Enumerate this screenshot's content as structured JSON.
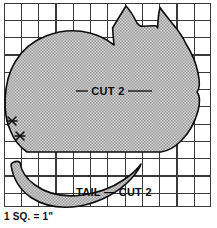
{
  "diagram": {
    "scale_caption": "1 SQ. = 1\"",
    "grid": {
      "square_size_px": 17.3,
      "columns": 12,
      "rows": 12,
      "line_color": "#3a3a3a",
      "origin_x": 4,
      "origin_y": 3
    },
    "colors": {
      "outline": "#0d0d0d",
      "fill": "#c9c9c9",
      "grid_line": "#3a3a3a",
      "background": "#ffffff",
      "text": "#0d0d0d"
    },
    "pieces": [
      {
        "id": "body",
        "label": "CUT 2",
        "label_x": 108,
        "label_y": 95,
        "leader_left_x1": 76,
        "leader_left_x2": 88,
        "leader_right_x1": 128,
        "leader_right_x2": 152,
        "leader_y": 91
      },
      {
        "id": "tail",
        "label": "TAIL — CUT 2",
        "label_x": 76,
        "label_y": 196
      }
    ],
    "markers": [
      {
        "id": "notch-upper",
        "symbol": "✳",
        "x": 12,
        "y": 121
      },
      {
        "id": "notch-lower",
        "symbol": "✳",
        "x": 20,
        "y": 136
      }
    ]
  }
}
